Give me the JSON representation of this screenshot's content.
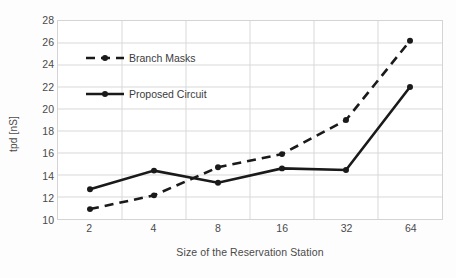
{
  "chart_data": {
    "type": "line",
    "title": "",
    "xlabel": "Size of the Reservation Station",
    "ylabel": "tpd [nS]",
    "categories": [
      "2",
      "4",
      "8",
      "16",
      "32",
      "64"
    ],
    "ylim": [
      10,
      28
    ],
    "yticks": [
      "28",
      "26",
      "24",
      "22",
      "20",
      "18",
      "16",
      "14",
      "12",
      "10"
    ],
    "ytick_step": 2,
    "grid": true,
    "legend_position": "inside-top-left",
    "series": [
      {
        "name": "Branch Masks",
        "style": "dashed",
        "color": "#1a1a1a",
        "marker": "dot",
        "values": [
          10.9,
          12.15,
          14.7,
          15.9,
          19.0,
          26.2
        ]
      },
      {
        "name": "Proposed Circuit",
        "style": "solid",
        "color": "#1a1a1a",
        "marker": "dot",
        "values": [
          12.7,
          14.4,
          13.3,
          14.6,
          14.45,
          22.0
        ]
      }
    ]
  },
  "axes": {
    "y_title": "tpd [nS]",
    "x_title": "Size of the Reservation Station"
  },
  "colors": {
    "grid": "#d9d9d9",
    "frame": "#d4d4d4",
    "ink": "#1a1a1a",
    "text": "#4a4a4a",
    "background": "#ffffff"
  }
}
